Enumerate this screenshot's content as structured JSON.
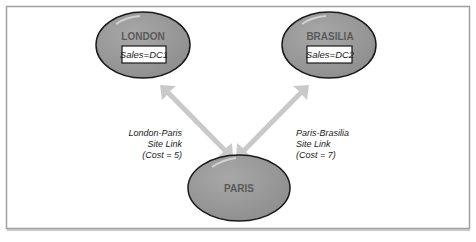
{
  "diagram": {
    "nodes": [
      {
        "id": "london",
        "label": "LONDON",
        "box": "Sales=DC1"
      },
      {
        "id": "brasilia",
        "label": "BRASILIA",
        "box": "Sales=DC2"
      },
      {
        "id": "paris",
        "label": "PARIS"
      }
    ],
    "links": [
      {
        "from": "london",
        "to": "paris",
        "lines": [
          "London-Paris",
          "Site Link",
          "(Cost = 5)"
        ]
      },
      {
        "from": "paris",
        "to": "brasilia",
        "lines": [
          "Paris-Brasilia",
          "Site Link",
          "(Cost = 7)"
        ]
      }
    ],
    "colors": {
      "ellipse_fill": "#9a9a9a",
      "ellipse_stroke": "#1a1a1a",
      "arrow_fill": "#c8c8c8",
      "frame_stroke": "#9a9a9a"
    }
  }
}
